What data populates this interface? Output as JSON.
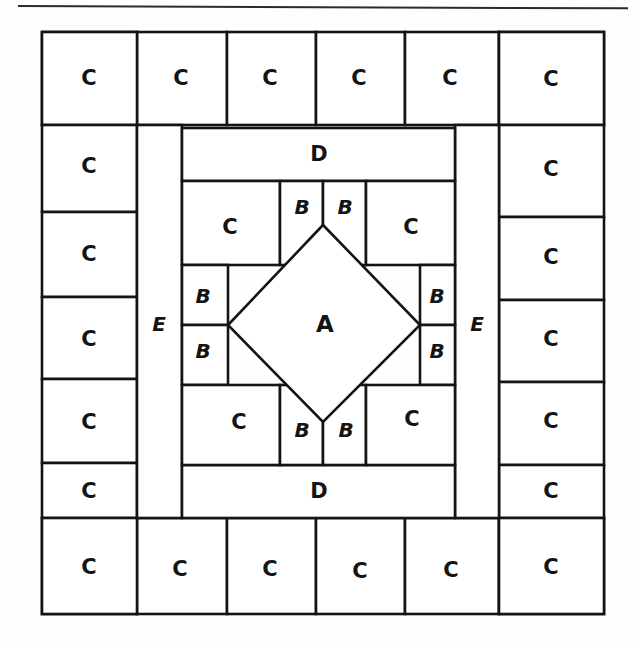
{
  "page": {
    "rule_visible": true,
    "background_color": "#fefefd",
    "ink_color": "#141414"
  },
  "diagram": {
    "type": "quilt-block-piecing-layout",
    "patch_letters": [
      "A",
      "B",
      "C",
      "D",
      "E"
    ],
    "counts": {
      "A": 1,
      "B": 8,
      "C": 28,
      "D": 2,
      "E": 2
    },
    "outer_border": {
      "top_row": {
        "label_repeat": "C",
        "cells": [
          {
            "label": "C"
          },
          {
            "label": "C"
          },
          {
            "label": "C"
          },
          {
            "label": "C"
          },
          {
            "label": "C"
          },
          {
            "label": "C"
          }
        ]
      },
      "bottom_row": {
        "label_repeat": "C",
        "cells": [
          {
            "label": "C"
          },
          {
            "label": "C"
          },
          {
            "label": "C"
          },
          {
            "label": "C"
          },
          {
            "label": "C"
          },
          {
            "label": "C"
          }
        ]
      },
      "left_column": {
        "label_repeat": "C",
        "cells": [
          {
            "label": "C"
          },
          {
            "label": "C"
          },
          {
            "label": "C"
          },
          {
            "label": "C"
          },
          {
            "label": "C"
          },
          {
            "label": "C"
          }
        ]
      },
      "right_column": {
        "label_repeat": "C",
        "cells": [
          {
            "label": "C"
          },
          {
            "label": "C"
          },
          {
            "label": "C"
          },
          {
            "label": "C"
          },
          {
            "label": "C"
          },
          {
            "label": "C"
          }
        ]
      }
    },
    "sashing": {
      "left_strip": {
        "label": "E"
      },
      "right_strip": {
        "label": "E"
      },
      "top_strip": {
        "label": "D"
      },
      "bottom_strip": {
        "label": "D"
      }
    },
    "center_unit": {
      "center_patch": {
        "label": "A"
      },
      "corner_squares": [
        {
          "label": "C",
          "position": "top-left"
        },
        {
          "label": "C",
          "position": "top-right"
        },
        {
          "label": "C",
          "position": "bottom-left"
        },
        {
          "label": "C",
          "position": "bottom-right"
        }
      ],
      "triangles": [
        {
          "label": "B",
          "position": "top-left"
        },
        {
          "label": "B",
          "position": "top-right"
        },
        {
          "label": "B",
          "position": "left-upper"
        },
        {
          "label": "B",
          "position": "left-lower"
        },
        {
          "label": "B",
          "position": "right-upper"
        },
        {
          "label": "B",
          "position": "right-lower"
        },
        {
          "label": "B",
          "position": "bottom-left"
        },
        {
          "label": "B",
          "position": "bottom-right"
        }
      ]
    }
  }
}
